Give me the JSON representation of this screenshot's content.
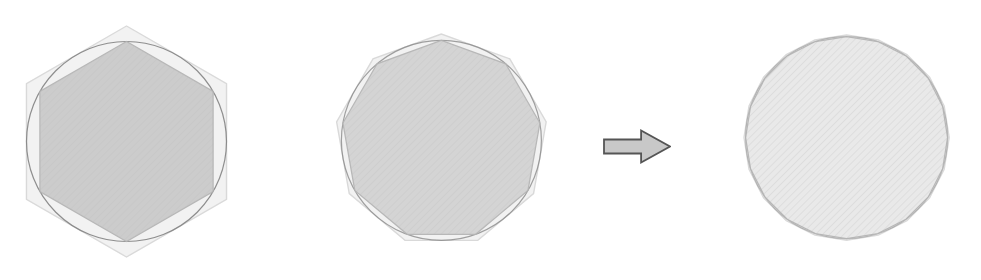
{
  "canvas": {
    "width": 981,
    "height": 280,
    "background_color": "#ffffff",
    "title": "Regular polygon approximation of a circle"
  },
  "palette": {
    "inner_fill_1": "#c9c9c9",
    "inner_fill_2": "#d2d2d2",
    "inner_fill_3": "#e9e9e9",
    "outer_fill": "#f2f2f2",
    "outer_stroke": "#d8d8d8",
    "circle_stroke": "#7c7c7c",
    "inner_stroke": "#b4b4b4",
    "hatch_stroke": "#bdbdbd",
    "arrow_fill": "#c8c8c8",
    "arrow_stroke": "#555555"
  },
  "figures": [
    {
      "id": "figure-hexagon",
      "name": "hexagon-approximation",
      "sides": 6,
      "center_x": 126,
      "center_y": 141,
      "circle_radius": 100,
      "inscribed_radius": 100,
      "circumscribed_radius": 115.5,
      "rotation_deg": 90,
      "inner_fill": "#c9c9c9",
      "show_circle": true,
      "circle_opacity": 0.85
    },
    {
      "id": "figure-nonagon",
      "name": "nonagon-approximation",
      "sides": 9,
      "center_x": 441,
      "center_y": 140,
      "circle_radius": 100,
      "inscribed_radius": 100,
      "circumscribed_radius": 106.4,
      "rotation_deg": 90,
      "inner_fill": "#d2d2d2",
      "show_circle": true,
      "circle_opacity": 0.7
    },
    {
      "id": "figure-circle",
      "name": "limit-circle-approximation",
      "sides": 20,
      "center_x": 847,
      "center_y": 138,
      "circle_radius": 101,
      "inscribed_radius": 101,
      "circumscribed_radius": 102.6,
      "rotation_deg": 90,
      "inner_fill": "#e9e9e9",
      "show_circle": true,
      "circle_opacity": 0.45
    }
  ],
  "arrow": {
    "name": "progression-arrow",
    "direction": "right",
    "x": 603,
    "y": 129,
    "width": 68,
    "height": 35,
    "fill": "#c8c8c8",
    "stroke": "#555555"
  }
}
